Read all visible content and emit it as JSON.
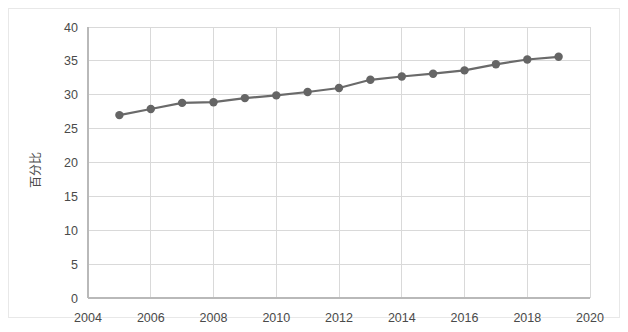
{
  "chart_data": {
    "type": "line",
    "title": "",
    "subtitle": "",
    "xlabel": "",
    "ylabel": "百分比",
    "xlim": [
      2004,
      2020
    ],
    "ylim": [
      0,
      40
    ],
    "x_ticks": [
      2004,
      2006,
      2008,
      2010,
      2012,
      2014,
      2016,
      2018,
      2020
    ],
    "y_ticks": [
      0,
      5,
      10,
      15,
      20,
      25,
      30,
      35,
      40
    ],
    "grid": true,
    "legend": "none",
    "marker": "circle",
    "line_color": "#6a6a6a",
    "marker_color": "#656565",
    "grid_color": "#d9d9d9",
    "x": [
      2005,
      2006,
      2007,
      2008,
      2009,
      2010,
      2011,
      2012,
      2013,
      2014,
      2015,
      2016,
      2017,
      2018,
      2019
    ],
    "series": [
      {
        "name": "百分比",
        "values": [
          27.0,
          27.9,
          28.8,
          28.9,
          29.5,
          29.9,
          30.4,
          31.0,
          32.2,
          32.7,
          33.1,
          33.6,
          34.5,
          35.2,
          35.6
        ]
      }
    ]
  },
  "axes": {
    "y_tick_labels": [
      "0",
      "5",
      "10",
      "15",
      "20",
      "25",
      "30",
      "35",
      "40"
    ],
    "x_tick_labels": [
      "2004",
      "2006",
      "2008",
      "2010",
      "2012",
      "2014",
      "2016",
      "2018",
      "2020"
    ],
    "y_axis_title": "百分比"
  }
}
